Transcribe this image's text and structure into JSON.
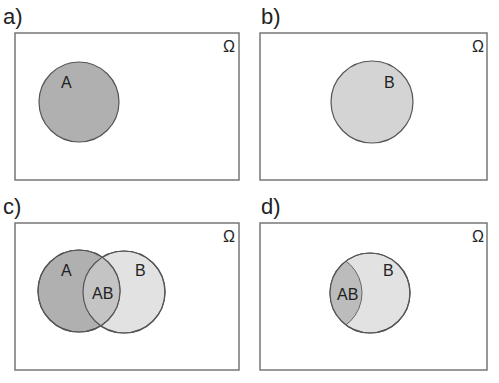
{
  "panels": [
    {
      "id": "a",
      "label": "a)",
      "universe": "Ω",
      "sets": [
        "A"
      ]
    },
    {
      "id": "b",
      "label": "b)",
      "universe": "Ω",
      "sets": [
        "B"
      ]
    },
    {
      "id": "c",
      "label": "c)",
      "universe": "Ω",
      "sets": [
        "A",
        "AB",
        "B"
      ]
    },
    {
      "id": "d",
      "label": "d)",
      "universe": "Ω",
      "sets": [
        "AB",
        "B"
      ]
    }
  ],
  "colors": {
    "dark_fill": "#b0b0b0",
    "light_fill": "#dcdcdc",
    "stroke": "#555555",
    "frame": "#777777"
  }
}
